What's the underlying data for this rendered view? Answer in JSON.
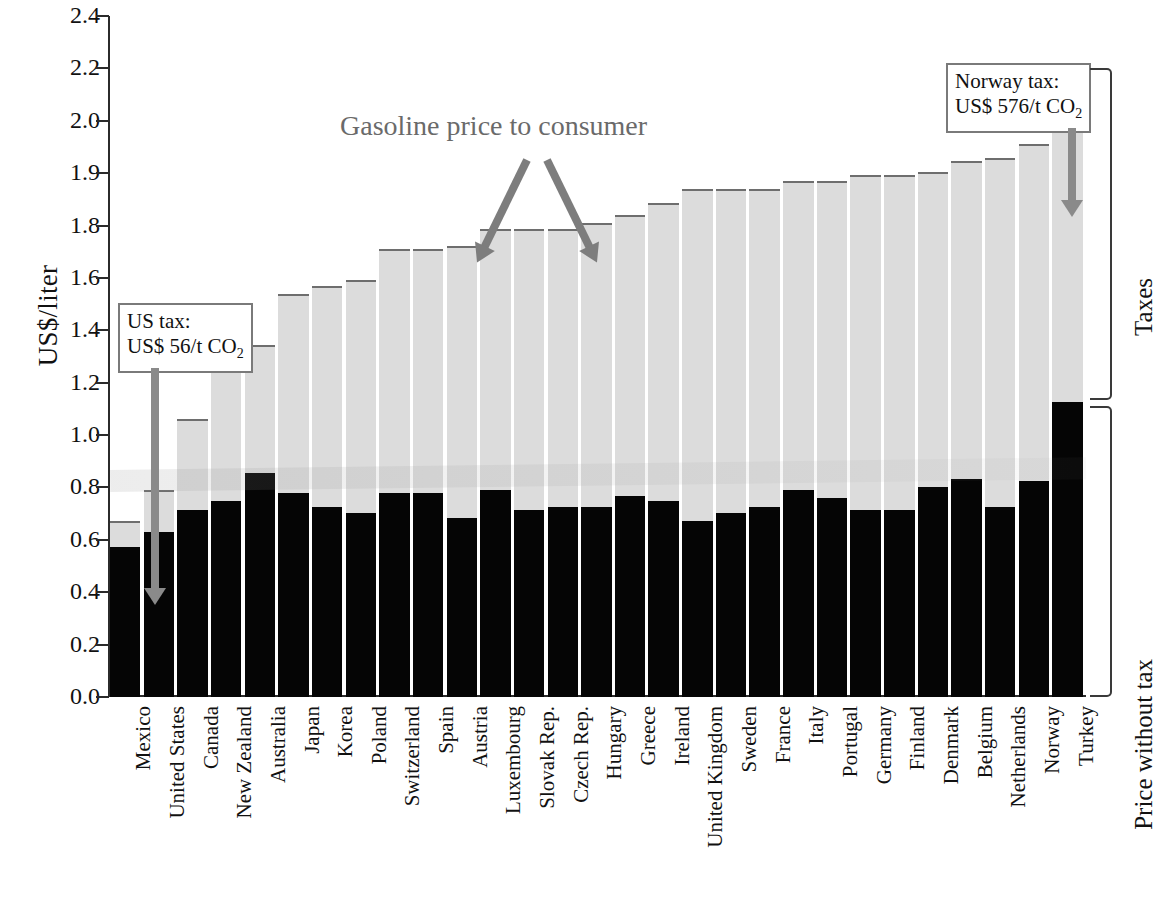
{
  "chart_data": {
    "type": "bar",
    "subtype": "stacked",
    "title": "",
    "xlabel": "",
    "ylabel": "US$/liter",
    "ylim": [
      0.0,
      2.4
    ],
    "grid": false,
    "legend_position": "right-braces",
    "y_tick_labels": [
      "2.4",
      "2.2",
      "2.0",
      "1.9",
      "1.8",
      "1.6",
      "1.4",
      "1.2",
      "1.0",
      "0.8",
      "0.6",
      "0.4",
      "0.2",
      "0.0"
    ],
    "y_tick_values": [
      2.4,
      2.2,
      2.0,
      1.9,
      1.8,
      1.6,
      1.4,
      1.2,
      1.0,
      0.8,
      0.6,
      0.4,
      0.2,
      0.0
    ],
    "categories": [
      "Mexico",
      "United States",
      "Canada",
      "New Zealand",
      "Australia",
      "Japan",
      "Korea",
      "Poland",
      "Switzerland",
      "Spain",
      "Austria",
      "Luxembourg",
      "Slovak Rep.",
      "Czech Rep.",
      "Hungary",
      "Greece",
      "Ireland",
      "United Kingdom",
      "Sweden",
      "France",
      "Italy",
      "Portugal",
      "Germany",
      "Finland",
      "Denmark",
      "Belgium",
      "Netherlands",
      "Norway",
      "Turkey"
    ],
    "series": [
      {
        "name": "Price without tax",
        "color": "#050505",
        "values": [
          0.53,
          0.58,
          0.66,
          0.69,
          0.79,
          0.72,
          0.67,
          0.65,
          0.72,
          0.72,
          0.63,
          0.73,
          0.66,
          0.67,
          0.67,
          0.71,
          0.69,
          0.62,
          0.65,
          0.67,
          0.73,
          0.7,
          0.66,
          0.66,
          0.74,
          0.77,
          0.67,
          0.76,
          1.04
        ]
      },
      {
        "name": "Taxes",
        "color": "#dcdcdc",
        "values": [
          0.09,
          0.15,
          0.32,
          0.54,
          0.45,
          0.7,
          0.78,
          0.82,
          0.86,
          0.86,
          0.96,
          0.92,
          0.99,
          0.98,
          1.0,
          0.99,
          1.05,
          1.17,
          1.14,
          1.12,
          1.09,
          1.12,
          1.18,
          1.18,
          1.11,
          1.12,
          1.23,
          1.19,
          1.17
        ]
      }
    ],
    "totals": [
      0.62,
      0.73,
      0.98,
      1.23,
      1.24,
      1.42,
      1.45,
      1.47,
      1.58,
      1.58,
      1.59,
      1.65,
      1.65,
      1.65,
      1.67,
      1.7,
      1.74,
      1.79,
      1.79,
      1.79,
      1.82,
      1.82,
      1.84,
      1.84,
      1.85,
      1.89,
      1.9,
      1.95,
      2.21
    ]
  },
  "annotations": {
    "consumer_label": "Gasoline price to consumer",
    "us_tax": {
      "line1": "US tax:",
      "line2_pre": "US$ 56/t CO",
      "line2_sub": "2"
    },
    "norway_tax": {
      "line1": "Norway tax:",
      "line2_pre": "US$ 576/t CO",
      "line2_sub": "2"
    }
  },
  "braces": {
    "taxes_label": "Taxes",
    "price_label": "Price without tax"
  },
  "axis": {
    "y_title": "US$/liter"
  },
  "colors": {
    "tax_fill": "#dcdcdc",
    "tax_stroke": "#6e6e6e",
    "net_fill": "#050505",
    "annotation_gray": "#7d7d7d",
    "axis": "#2b2b2b"
  }
}
